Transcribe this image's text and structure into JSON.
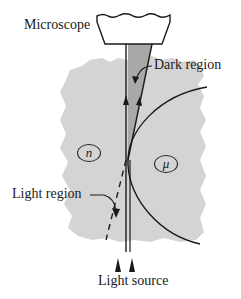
{
  "diagram": {
    "labels": {
      "microscope": "Microscope",
      "dark_region": "Dark region",
      "light_region": "Light region",
      "light_source": "Light source"
    },
    "media": {
      "left_medium": "n",
      "right_medium": "μ"
    },
    "colors": {
      "background": "#ffffff",
      "medium_fill": "#d4d4d4",
      "dark_region_fill": "#a9a9a9",
      "line": "#1a1a1a"
    }
  }
}
